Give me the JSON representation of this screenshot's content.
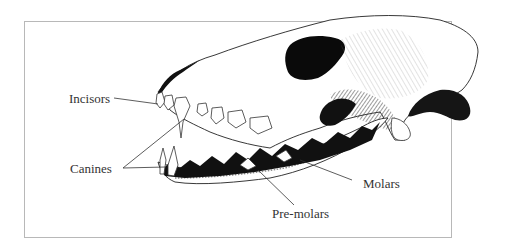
{
  "diagram": {
    "labels": [
      {
        "id": "incisors",
        "text": "Incisors"
      },
      {
        "id": "canines",
        "text": "Canines"
      },
      {
        "id": "molars",
        "text": "Molars"
      },
      {
        "id": "premolars",
        "text": "Pre-molars"
      }
    ],
    "colors": {
      "ink": "#111111",
      "label": "#333333",
      "frame": "#b8b8b8",
      "background": "#ffffff"
    }
  }
}
